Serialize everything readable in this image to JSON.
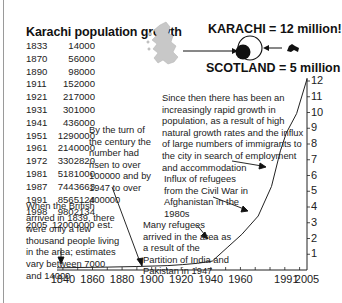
{
  "title": "Karachi population growth",
  "table": [
    {
      "year": "1833",
      "population": "14000"
    },
    {
      "year": "1870",
      "population": "56000"
    },
    {
      "year": "1890",
      "population": "98000"
    },
    {
      "year": "1911",
      "population": "152000"
    },
    {
      "year": "1921",
      "population": "217000"
    },
    {
      "year": "1931",
      "population": "301000"
    },
    {
      "year": "1941",
      "population": "436000"
    },
    {
      "year": "1951",
      "population": "1290000"
    },
    {
      "year": "1961",
      "population": "2140000"
    },
    {
      "year": "1972",
      "population": "3302820"
    },
    {
      "year": "1981",
      "population": "5181000"
    },
    {
      "year": "1987",
      "population": "7443663"
    },
    {
      "year": "1991",
      "population": "8565124"
    },
    {
      "year": "1998",
      "population": "9802134"
    },
    {
      "year": "2005",
      "population": "12000000 est."
    }
  ],
  "comparison": {
    "karachi_label": "KARACHI = 12 million!",
    "scotland_label": "SCOTLAND = 5 million",
    "scotland_map_icon": "scotland-map-icon",
    "karachi_map_icon": "karachi-shape-icon"
  },
  "annotations": {
    "since_then": "Since then there has been an increasingly rapid growth in population, as a result of high natural growth rates and the influx of large numbers of immigrants to the city in search of employment and accommodation",
    "turn_of_century": "By the turn of the century the number had risen to over 100000 and by 1947 to over 400000",
    "afghanistan": "Influx of refugees from the Civil War in Afghanistan in the 1980s",
    "partition": "Many refugees arrived in the area as a result of the Partition of India and Pakistan in 1947",
    "british": "When the British arrived in 1839, there were only a few thousand people living in the area; estimates vary between 7000 and 14000"
  },
  "chart_data": {
    "type": "line",
    "title": "Karachi population growth",
    "xlabel": "",
    "ylabel": "Population (millions)",
    "x_ticks": [
      "1840",
      "1860",
      "1880",
      "1900",
      "1920",
      "1940",
      "1960",
      "1991",
      "2005"
    ],
    "y_ticks": [
      "1",
      "2",
      "3",
      "4",
      "5",
      "6",
      "7",
      "8",
      "9",
      "10",
      "11",
      "12"
    ],
    "ylim": [
      0,
      12
    ],
    "xlim": [
      1835,
      2005
    ],
    "grid": false,
    "series": [
      {
        "name": "Karachi population (millions)",
        "x": [
          1833,
          1870,
          1890,
          1911,
          1921,
          1931,
          1941,
          1951,
          1961,
          1972,
          1981,
          1987,
          1991,
          1998,
          2005
        ],
        "values": [
          0.014,
          0.056,
          0.098,
          0.152,
          0.217,
          0.301,
          0.436,
          1.29,
          2.14,
          3.3,
          5.18,
          7.44,
          8.57,
          9.8,
          12.0
        ]
      }
    ]
  }
}
